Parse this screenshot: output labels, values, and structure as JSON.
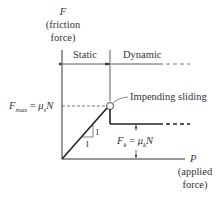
{
  "y_axis": {
    "symbol": "F",
    "caption_line1": "(friction",
    "caption_line2": "force)"
  },
  "x_axis": {
    "symbol": "P",
    "caption_line1": "(applied",
    "caption_line2": "force)"
  },
  "regions": {
    "static": "Static",
    "dynamic": "Dynamic"
  },
  "fmax_label": {
    "lhs": "F",
    "lhs_sub": "max",
    "eq": " = ",
    "mu": "μ",
    "mu_sub": "s",
    "n": "N"
  },
  "fk_label": {
    "lhs": "F",
    "lhs_sub": "k",
    "eq": " = ",
    "mu": "μ",
    "mu_sub": "k",
    "n": "N"
  },
  "annotation": "Impending sliding",
  "slope": {
    "rise": "1",
    "run": "1"
  },
  "colors": {
    "line": "#222222",
    "dash": "#555555"
  }
}
